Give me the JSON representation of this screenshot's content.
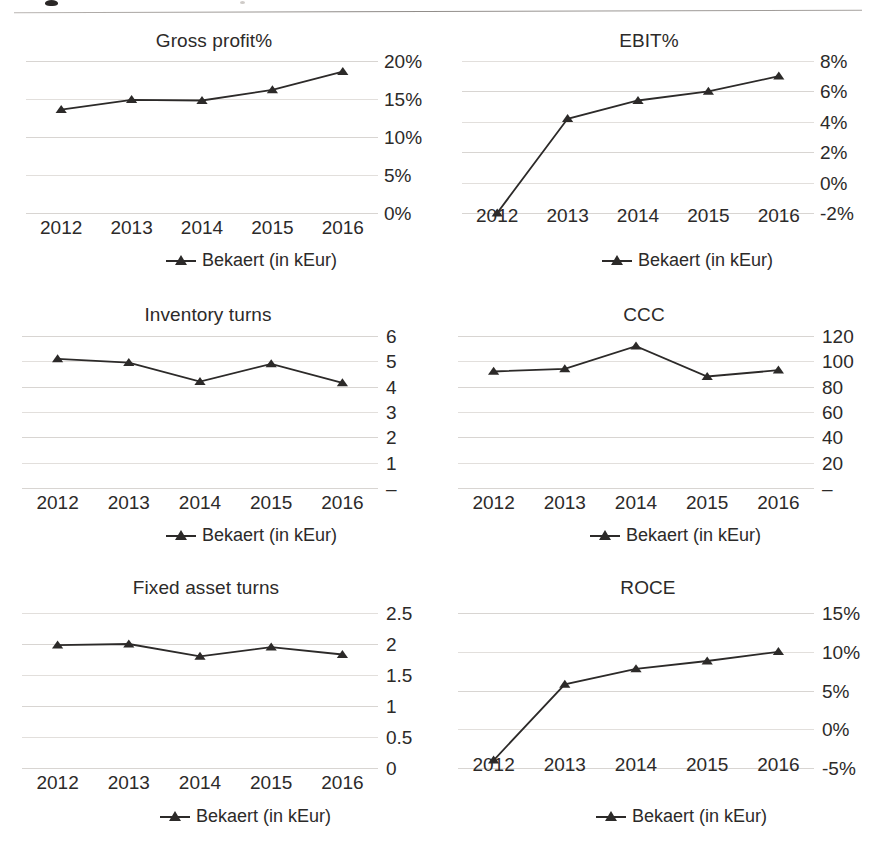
{
  "document": {
    "top_rule": true
  },
  "legend_label_default": "Bekaert (in kEur)",
  "legend_label_spaced": "Bekaert  (in kEur)",
  "chart_data": [
    {
      "id": "gross-profit",
      "type": "line",
      "title": "Gross profit%",
      "xlabel": "",
      "ylabel": "",
      "categories": [
        "2012",
        "2013",
        "2014",
        "2015",
        "2016"
      ],
      "yticks": [
        "0%",
        "5%",
        "10%",
        "15%",
        "20%"
      ],
      "ytick_values": [
        0,
        5,
        10,
        15,
        20
      ],
      "ylim": [
        0,
        20
      ],
      "grid": true,
      "legend": [
        "Bekaert (in kEur)"
      ],
      "legend_position": "bottom",
      "series": [
        {
          "name": "Bekaert (in kEur)",
          "values": [
            13.6,
            14.9,
            14.8,
            16.2,
            18.6
          ]
        }
      ]
    },
    {
      "id": "ebit",
      "type": "line",
      "title": "EBIT%",
      "xlabel": "",
      "ylabel": "",
      "categories": [
        "2012",
        "2013",
        "2014",
        "2015",
        "2016"
      ],
      "yticks": [
        "-2%",
        "0%",
        "2%",
        "4%",
        "6%",
        "8%"
      ],
      "ytick_values": [
        -2,
        0,
        2,
        4,
        6,
        8
      ],
      "ylim": [
        -2,
        8
      ],
      "grid": true,
      "legend": [
        "Bekaert (in kEur)"
      ],
      "legend_position": "bottom",
      "series": [
        {
          "name": "Bekaert (in kEur)",
          "values": [
            -2.0,
            4.2,
            5.4,
            6.0,
            7.0
          ]
        }
      ]
    },
    {
      "id": "inventory-turns",
      "type": "line",
      "title": "Inventory turns",
      "xlabel": "",
      "ylabel": "",
      "categories": [
        "2012",
        "2013",
        "2014",
        "2015",
        "2016"
      ],
      "yticks": [
        "–",
        "1",
        "2",
        "3",
        "4",
        "5",
        "6"
      ],
      "ytick_values": [
        0,
        1,
        2,
        3,
        4,
        5,
        6
      ],
      "ylim": [
        0,
        6
      ],
      "grid": true,
      "legend": [
        "Bekaert (in kEur)"
      ],
      "legend_position": "bottom",
      "series": [
        {
          "name": "Bekaert (in kEur)",
          "values": [
            5.1,
            4.95,
            4.2,
            4.9,
            4.15
          ]
        }
      ]
    },
    {
      "id": "ccc",
      "type": "line",
      "title": "CCC",
      "xlabel": "",
      "ylabel": "",
      "categories": [
        "2012",
        "2013",
        "2014",
        "2015",
        "2016"
      ],
      "yticks": [
        "–",
        "20",
        "40",
        "60",
        "80",
        "100",
        "120"
      ],
      "ytick_values": [
        0,
        20,
        40,
        60,
        80,
        100,
        120
      ],
      "ylim": [
        0,
        120
      ],
      "grid": true,
      "legend": [
        "Bekaert (in kEur)"
      ],
      "legend_position": "bottom",
      "series": [
        {
          "name": "Bekaert (in kEur)",
          "values": [
            92,
            94,
            112,
            88,
            93
          ]
        }
      ]
    },
    {
      "id": "fixed-asset-turns",
      "type": "line",
      "title": "Fixed asset turns",
      "xlabel": "",
      "ylabel": "",
      "categories": [
        "2012",
        "2013",
        "2014",
        "2015",
        "2016"
      ],
      "yticks": [
        "0",
        "0.5",
        "1",
        "1.5",
        "2",
        "2.5"
      ],
      "ytick_values": [
        0,
        0.5,
        1,
        1.5,
        2,
        2.5
      ],
      "ylim": [
        0,
        2.5
      ],
      "grid": true,
      "legend": [
        "Bekaert  (in kEur)"
      ],
      "legend_position": "bottom",
      "series": [
        {
          "name": "Bekaert  (in kEur)",
          "values": [
            1.98,
            2.0,
            1.8,
            1.95,
            1.83
          ]
        }
      ]
    },
    {
      "id": "roce",
      "type": "line",
      "title": "ROCE",
      "xlabel": "",
      "ylabel": "",
      "categories": [
        "2012",
        "2013",
        "2014",
        "2015",
        "2016"
      ],
      "yticks": [
        "-5%",
        "0%",
        "5%",
        "10%",
        "15%"
      ],
      "ytick_values": [
        -5,
        0,
        5,
        10,
        15
      ],
      "ylim": [
        -5,
        15
      ],
      "grid": true,
      "legend": [
        "Bekaert  (in kEur)"
      ],
      "legend_position": "bottom",
      "series": [
        {
          "name": "Bekaert  (in kEur)",
          "values": [
            -4.0,
            5.8,
            7.8,
            8.8,
            10.0
          ]
        }
      ]
    }
  ]
}
